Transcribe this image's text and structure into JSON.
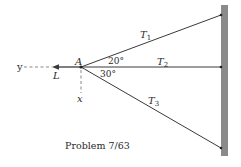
{
  "figure": {
    "caption": "Problem 7/63",
    "point_label": "A",
    "force_label": "L",
    "axis_y_label": "y",
    "axis_x_label": "x",
    "cables": [
      {
        "label": "T",
        "sub": "1"
      },
      {
        "label": "T",
        "sub": "2"
      },
      {
        "label": "T",
        "sub": "3"
      }
    ],
    "angles": [
      {
        "value": "20°",
        "between": "T1 and T2"
      },
      {
        "value": "30°",
        "between": "T2 and T3"
      }
    ],
    "colors": {
      "line": "#3a3a3a",
      "wall": "#8a8a8a",
      "dashed": "#7a7a7a",
      "text": "#2a2a2a"
    }
  }
}
